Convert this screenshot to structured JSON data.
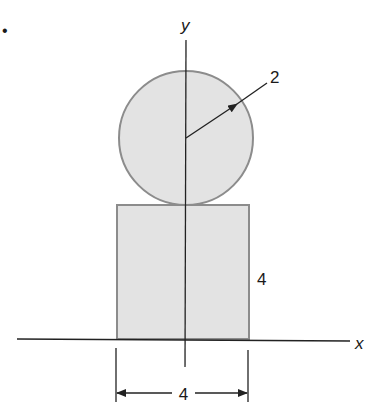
{
  "bullet": "•",
  "axes": {
    "x_label": "x",
    "y_label": "y"
  },
  "circle": {
    "radius_label": "2"
  },
  "rectangle": {
    "height_label": "4",
    "width_label": "4"
  },
  "colors": {
    "fill": "#e3e3e3",
    "outline": "#8c8c8c",
    "line": "#222222"
  }
}
